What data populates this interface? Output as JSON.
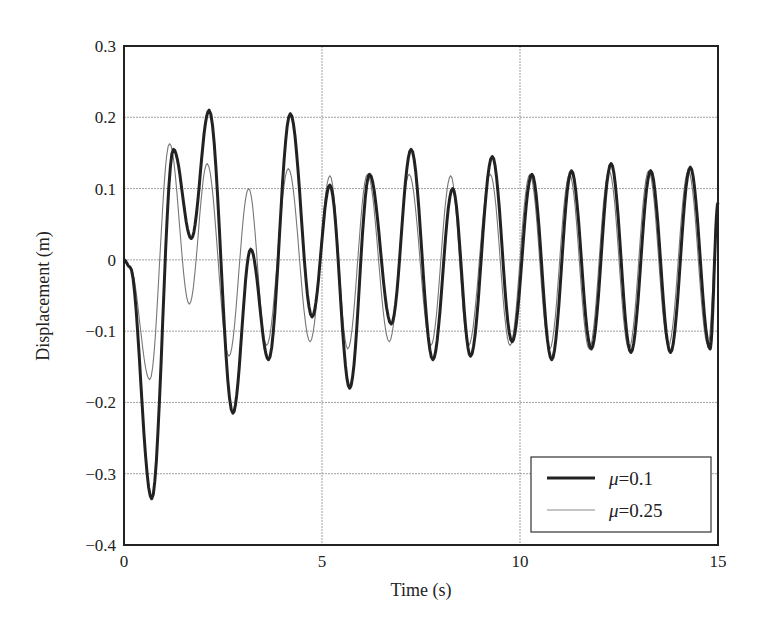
{
  "chart_data": {
    "type": "line",
    "title": "",
    "xlabel": "Time (s)",
    "ylabel": "Displacement (m)",
    "xlim": [
      0,
      15
    ],
    "ylim": [
      -0.4,
      0.3
    ],
    "xticks": [
      0,
      5,
      10,
      15
    ],
    "xtick_labels": [
      "0",
      "5",
      "10",
      "15"
    ],
    "yticks": [
      0.3,
      0.2,
      0.1,
      0,
      -0.1,
      -0.2,
      -0.3,
      -0.4
    ],
    "ytick_labels": [
      "0.3",
      "0.2",
      "0.1",
      "0",
      "−0.1",
      "−0.2",
      "−0.3",
      "−0.4"
    ],
    "grid": true,
    "legend_position": "lower right",
    "series": [
      {
        "name": "μ=0.1",
        "style": "thick",
        "color": "#222222",
        "x": [
          0,
          0.15,
          0.7,
          1.25,
          1.7,
          2.15,
          2.75,
          3.2,
          3.65,
          4.2,
          4.75,
          5.2,
          5.7,
          6.2,
          6.75,
          7.25,
          7.8,
          8.3,
          8.75,
          9.3,
          9.8,
          10.3,
          10.8,
          11.3,
          11.8,
          12.3,
          12.8,
          13.3,
          13.8,
          14.3,
          14.8,
          15
        ],
        "y": [
          0,
          -0.01,
          -0.335,
          0.155,
          0.03,
          0.21,
          -0.215,
          0.015,
          -0.14,
          0.205,
          -0.08,
          0.105,
          -0.18,
          0.12,
          -0.09,
          0.155,
          -0.14,
          0.1,
          -0.135,
          0.145,
          -0.115,
          0.12,
          -0.14,
          0.125,
          -0.125,
          0.135,
          -0.13,
          0.125,
          -0.13,
          0.13,
          -0.125,
          0.08
        ]
      },
      {
        "name": "μ=0.25",
        "style": "thin",
        "color": "#777777",
        "x": [
          0,
          0.15,
          0.65,
          1.15,
          1.65,
          2.1,
          2.65,
          3.15,
          3.6,
          4.15,
          4.7,
          5.2,
          5.65,
          6.15,
          6.7,
          7.2,
          7.75,
          8.25,
          8.7,
          9.25,
          9.75,
          10.25,
          10.75,
          11.25,
          11.75,
          12.25,
          12.75,
          13.25,
          13.75,
          14.25,
          14.75,
          15
        ],
        "y": [
          0,
          -0.01,
          -0.168,
          0.163,
          -0.062,
          0.135,
          -0.135,
          0.1,
          -0.12,
          0.128,
          -0.115,
          0.118,
          -0.125,
          0.12,
          -0.115,
          0.12,
          -0.12,
          0.118,
          -0.12,
          0.12,
          -0.12,
          0.12,
          -0.125,
          0.12,
          -0.125,
          0.125,
          -0.125,
          0.125,
          -0.12,
          0.125,
          -0.12,
          0.06
        ]
      }
    ]
  },
  "legend": {
    "items": [
      {
        "symbol": "μ",
        "eq": "=0.1"
      },
      {
        "symbol": "μ",
        "eq": "=0.25"
      }
    ]
  }
}
